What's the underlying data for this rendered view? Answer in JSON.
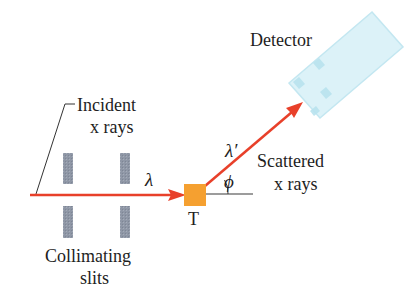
{
  "labels": {
    "detector": "Detector",
    "incident_line1": "Incident",
    "incident_line2": "x rays",
    "scattered_line1": "Scattered",
    "scattered_line2": "x rays",
    "collimating_line1": "Collimating",
    "collimating_line2": "slits",
    "target": "T"
  },
  "symbols": {
    "incident_wavelength": "λ",
    "scattered_wavelength": "λ′",
    "scattering_angle": "ϕ"
  },
  "colors": {
    "beam": "#e8402a",
    "target": "#f5a030",
    "slit": "#8e96a4",
    "detector_fill": "#d8f1f8",
    "detector_stroke": "#bfe6f1",
    "detector_pad": "#b7e2ef",
    "line": "#3a3a3a",
    "text": "#1e1e1e"
  }
}
